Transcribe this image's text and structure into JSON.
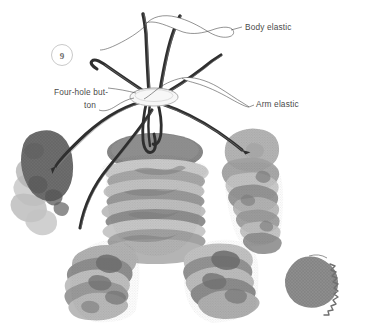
{
  "illustration": {
    "title": "Stacked fabric disc figure assembly",
    "step_number": "9",
    "background_color": "#ffffff",
    "ink_color": "#3a3a3a",
    "label_color": "#4a4a4a"
  },
  "labels": {
    "body_elastic": "Body elastic",
    "arm_elastic": "Arm elastic",
    "four_hole_button_line1": "Four-hole but-",
    "four_hole_button_line2": "ton"
  },
  "parts": {
    "button": {
      "name": "four-hole-button",
      "color": "#f2f2f2",
      "outline": "#9a9a9a"
    },
    "body_stack": {
      "name": "body-disc-stack",
      "top_disc_color": "#8d8d8d",
      "disc_colors": [
        "#8d8d8d",
        "#bdbdbd",
        "#9c9c9c",
        "#cfcfcf",
        "#a8a8a8",
        "#bebebe",
        "#979797",
        "#c8c8c8",
        "#a2a2a2",
        "#b4b4b4"
      ]
    },
    "left_arm": {
      "name": "left-arm-disc-stack",
      "disc_colors": [
        "#7c7c7c",
        "#6f6f6f",
        "#c4c4c4",
        "#9b9b9b",
        "#b7b7b7",
        "#8a8a8a"
      ]
    },
    "right_arm": {
      "name": "right-arm-disc-stack",
      "disc_colors": [
        "#b9b9b9",
        "#a6a6a6",
        "#c6c6c6",
        "#8f8f8f",
        "#b2b2b2",
        "#9a9a9a",
        "#c0c0c0",
        "#8a8a8a"
      ]
    },
    "left_leg": {
      "name": "left-leg-disc-stack",
      "disc_colors": [
        "#9e9e9e",
        "#c2c2c2",
        "#868686",
        "#b0b0b0",
        "#757575",
        "#bdbdbd"
      ]
    },
    "right_leg": {
      "name": "right-leg-disc-stack",
      "disc_colors": [
        "#b5b5b5",
        "#8b8b8b",
        "#c9c9c9",
        "#9d9d9d",
        "#7e7e7e"
      ],
      "pinked_disc_color": "#8a8a8a"
    },
    "elastic_cords": {
      "name": "elastic-cords",
      "color": "#2f2f2f",
      "highlight": "#8c8c8c",
      "count": "6"
    }
  }
}
